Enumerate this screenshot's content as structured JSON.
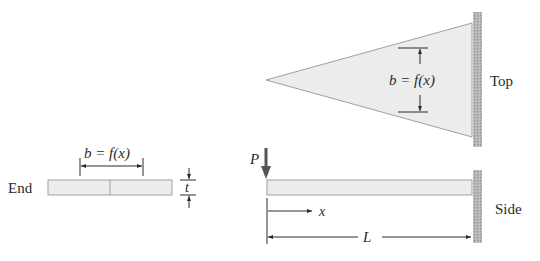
{
  "figure": {
    "views": {
      "end": {
        "label": "End",
        "width_label": "b = f(x)",
        "thickness_label": "t"
      },
      "top": {
        "label": "Top",
        "width_label": "b = f(x)"
      },
      "side": {
        "label": "Side",
        "load_label": "P",
        "position_label": "x",
        "length_label": "L"
      }
    },
    "colors": {
      "beam_fill": "#ececec",
      "beam_stroke": "#9a9a9a",
      "wall": "#a8a8a8",
      "line": "#2a2a2a"
    }
  }
}
